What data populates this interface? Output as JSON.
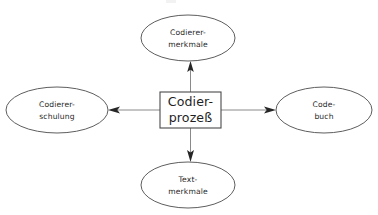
{
  "diagram": {
    "type": "radial-concept-diagram",
    "background_color": "#ffffff",
    "stroke_color": "#5e5e5e",
    "arrow_color": "#262626",
    "text_color": "#1f1f1f",
    "center_node": {
      "id": "codierprozess",
      "shape": "rectangle",
      "line1": "Codier-",
      "line2": "prozeß",
      "x": 190.5,
      "y": 110,
      "width": 61,
      "height": 36
    },
    "nodes": [
      {
        "id": "codierer-merkmale",
        "shape": "ellipse",
        "position": "top",
        "line1": "Codierer-",
        "line2": "merkmale",
        "cx": 188,
        "cy": 38,
        "rx": 47,
        "ry": 23
      },
      {
        "id": "codierer-schulung",
        "shape": "ellipse",
        "position": "left",
        "line1": "Codierer-",
        "line2": "schulung",
        "cx": 57,
        "cy": 110,
        "rx": 51,
        "ry": 23
      },
      {
        "id": "code-buch",
        "shape": "ellipse",
        "position": "right",
        "line1": "Code-",
        "line2": "buch",
        "cx": 324,
        "cy": 110,
        "rx": 48,
        "ry": 23
      },
      {
        "id": "text-merkmale",
        "shape": "ellipse",
        "position": "bottom",
        "line1": "Text-",
        "line2": "merkmale",
        "cx": 188,
        "cy": 185,
        "rx": 47,
        "ry": 23
      }
    ],
    "connectors": [
      {
        "id": "arrow-center-to-top",
        "from": "codierprozess",
        "to": "codierer-merkmale",
        "direction": "up",
        "arrowhead": "solid-triangle"
      },
      {
        "id": "arrow-center-to-left",
        "from": "codierprozess",
        "to": "codierer-schulung",
        "direction": "left",
        "arrowhead": "solid-triangle"
      },
      {
        "id": "arrow-center-to-right",
        "from": "codierprozess",
        "to": "code-buch",
        "direction": "right",
        "arrowhead": "solid-triangle"
      },
      {
        "id": "arrow-center-to-bottom",
        "from": "codierprozess",
        "to": "text-merkmale",
        "direction": "down",
        "arrowhead": "solid-triangle"
      }
    ]
  }
}
